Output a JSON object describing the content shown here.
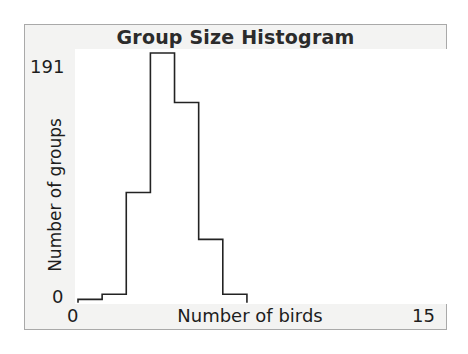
{
  "figure": {
    "title": "Group Size Histogram",
    "frame_color": "#a9a9a9",
    "panel_color": "#f3f3f2",
    "plot_color": "#ffffff",
    "ink_color": "#232323"
  },
  "axes": {
    "y_tick_max": "191",
    "y_tick_min": "0",
    "y_title": "Number of groups",
    "x_tick_min": "0",
    "x_tick_max": "15",
    "x_title": "Number of birds"
  },
  "chart_data": {
    "type": "bar",
    "title": "Group Size Histogram",
    "xlabel": "Number of birds",
    "ylabel": "Number of groups",
    "xlim": [
      0,
      15
    ],
    "ylim": [
      0,
      191
    ],
    "grid": false,
    "legend": null,
    "bin_width": 1,
    "bin_edges": [
      0,
      1,
      2,
      3,
      4,
      5,
      6,
      7
    ],
    "categories": [
      "0-1",
      "1-2",
      "2-3",
      "3-4",
      "4-5",
      "5-6",
      "6-7"
    ],
    "x": [
      0.5,
      1.5,
      2.5,
      3.5,
      4.5,
      5.5,
      6.5
    ],
    "values": [
      2,
      6,
      84,
      191,
      153,
      48,
      6
    ],
    "tick_labels": {
      "x": [
        "0",
        "15"
      ],
      "y": [
        "0",
        "191"
      ]
    },
    "annotations": []
  }
}
